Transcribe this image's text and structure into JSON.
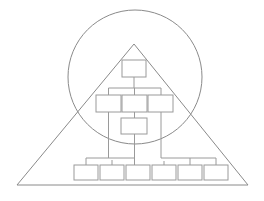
{
  "figure": {
    "title": "",
    "background_color": "#ffffff",
    "stroke_color": "#8a8a8a",
    "box_stroke_color": "#9a9a9a",
    "width": 264,
    "height": 201
  },
  "shapes": {
    "triangle": {
      "name": "triangle",
      "apex": {
        "x": 134,
        "y": 44
      },
      "base_left": {
        "x": 17,
        "y": 185
      },
      "base_right": {
        "x": 248,
        "y": 185
      },
      "points": "134,44 248,185 17,185"
    },
    "circle": {
      "name": "circle",
      "center_x": 135,
      "center_y": 77,
      "radius": 67
    }
  },
  "org_chart": {
    "name": "organization-chart",
    "levels": [
      {
        "level": 1,
        "boxes": [
          {
            "id": "box-l1-1",
            "label": "",
            "x": 122,
            "y": 60,
            "w": 24,
            "h": 17
          }
        ]
      },
      {
        "level": 2,
        "boxes": [
          {
            "id": "box-l2-1",
            "label": "",
            "x": 96,
            "y": 95,
            "w": 25,
            "h": 17
          },
          {
            "id": "box-l2-2",
            "label": "",
            "x": 122,
            "y": 95,
            "w": 25,
            "h": 17
          },
          {
            "id": "box-l2-3",
            "label": "",
            "x": 148,
            "y": 95,
            "w": 25,
            "h": 17
          }
        ]
      },
      {
        "level": 3,
        "boxes": [
          {
            "id": "box-l3-1",
            "label": "",
            "x": 121,
            "y": 118,
            "w": 26,
            "h": 16
          }
        ]
      },
      {
        "level": 4,
        "boxes": [
          {
            "id": "box-l4-1",
            "label": "",
            "x": 74,
            "y": 165,
            "w": 24,
            "h": 15
          },
          {
            "id": "box-l4-2",
            "label": "",
            "x": 100,
            "y": 165,
            "w": 24,
            "h": 15
          },
          {
            "id": "box-l4-3",
            "label": "",
            "x": 126,
            "y": 165,
            "w": 24,
            "h": 15
          },
          {
            "id": "box-l4-4",
            "label": "",
            "x": 152,
            "y": 165,
            "w": 24,
            "h": 15
          },
          {
            "id": "box-l4-5",
            "label": "",
            "x": 178,
            "y": 165,
            "w": 24,
            "h": 15
          },
          {
            "id": "box-l4-6",
            "label": "",
            "x": 204,
            "y": 165,
            "w": 24,
            "h": 15
          }
        ]
      }
    ],
    "connectors": [
      {
        "id": "link-l1-to-bus",
        "path": "M134,77 L134,88"
      },
      {
        "id": "link-bus-l2",
        "path": "M108.5,88 L161,88"
      },
      {
        "id": "link-bus-l2-left",
        "path": "M108.5,88 L108.5,95"
      },
      {
        "id": "link-bus-l2-mid",
        "path": "M134.5,88 L134.5,95"
      },
      {
        "id": "link-bus-l2-right",
        "path": "M161,88 L161,95"
      },
      {
        "id": "link-l2mid-to-l3",
        "path": "M134.5,112 L134.5,118"
      },
      {
        "id": "link-l3-down",
        "path": "M134.5,134 L134.5,165"
      },
      {
        "id": "link-l2left-down",
        "path": "M108.5,112 L108.5,158"
      },
      {
        "id": "link-l2right-down",
        "path": "M161,112 L161,158"
      },
      {
        "id": "link-left-bus",
        "path": "M86,158 L134.5,158"
      },
      {
        "id": "link-left-bus-b1",
        "path": "M86,158 L86,165"
      },
      {
        "id": "link-left-bus-b2",
        "path": "M112,160 L112,165"
      },
      {
        "id": "link-right-bus",
        "path": "M161,158 L216,158"
      },
      {
        "id": "link-right-bus-b5",
        "path": "M190,158 L190,165"
      },
      {
        "id": "link-right-bus-b6",
        "path": "M216,158 L216,165"
      },
      {
        "id": "link-mid-b4",
        "path": "M164,161 L164,165"
      }
    ]
  }
}
